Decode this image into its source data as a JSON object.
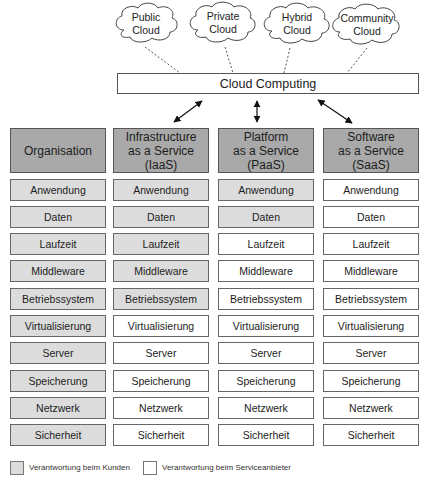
{
  "clouds": [
    {
      "line1": "Public",
      "line2": "Cloud"
    },
    {
      "line1": "Private",
      "line2": "Cloud"
    },
    {
      "line1": "Hybrid",
      "line2": "Cloud"
    },
    {
      "line1": "Community",
      "line2": "Cloud"
    }
  ],
  "cloud_computing": {
    "label": "Cloud Computing"
  },
  "columns": [
    {
      "header": [
        "Organisation"
      ],
      "cells": [
        {
          "label": "Anwendung",
          "responsibility": "customer"
        },
        {
          "label": "Daten",
          "responsibility": "customer"
        },
        {
          "label": "Laufzeit",
          "responsibility": "customer"
        },
        {
          "label": "Middleware",
          "responsibility": "customer"
        },
        {
          "label": "Betriebssystem",
          "responsibility": "customer"
        },
        {
          "label": "Virtualisierung",
          "responsibility": "customer"
        },
        {
          "label": "Server",
          "responsibility": "customer"
        },
        {
          "label": "Speicherung",
          "responsibility": "customer"
        },
        {
          "label": "Netzwerk",
          "responsibility": "customer"
        },
        {
          "label": "Sicherheit",
          "responsibility": "customer"
        }
      ]
    },
    {
      "header": [
        "Infrastructure",
        "as a Service",
        "(IaaS)"
      ],
      "cells": [
        {
          "label": "Anwendung",
          "responsibility": "customer"
        },
        {
          "label": "Daten",
          "responsibility": "customer"
        },
        {
          "label": "Laufzeit",
          "responsibility": "customer"
        },
        {
          "label": "Middleware",
          "responsibility": "customer"
        },
        {
          "label": "Betriebssystem",
          "responsibility": "customer"
        },
        {
          "label": "Virtualisierung",
          "responsibility": "provider"
        },
        {
          "label": "Server",
          "responsibility": "provider"
        },
        {
          "label": "Speicherung",
          "responsibility": "provider"
        },
        {
          "label": "Netzwerk",
          "responsibility": "provider"
        },
        {
          "label": "Sicherheit",
          "responsibility": "provider"
        }
      ]
    },
    {
      "header": [
        "Platform",
        "as a Service",
        "(PaaS)"
      ],
      "cells": [
        {
          "label": "Anwendung",
          "responsibility": "customer"
        },
        {
          "label": "Daten",
          "responsibility": "customer"
        },
        {
          "label": "Laufzeit",
          "responsibility": "provider"
        },
        {
          "label": "Middleware",
          "responsibility": "provider"
        },
        {
          "label": "Betriebssystem",
          "responsibility": "provider"
        },
        {
          "label": "Virtualisierung",
          "responsibility": "provider"
        },
        {
          "label": "Server",
          "responsibility": "provider"
        },
        {
          "label": "Speicherung",
          "responsibility": "provider"
        },
        {
          "label": "Netzwerk",
          "responsibility": "provider"
        },
        {
          "label": "Sicherheit",
          "responsibility": "provider"
        }
      ]
    },
    {
      "header": [
        "Software",
        "as a Service",
        "(SaaS)"
      ],
      "cells": [
        {
          "label": "Anwendung",
          "responsibility": "provider"
        },
        {
          "label": "Daten",
          "responsibility": "provider"
        },
        {
          "label": "Laufzeit",
          "responsibility": "provider"
        },
        {
          "label": "Middleware",
          "responsibility": "provider"
        },
        {
          "label": "Betriebssystem",
          "responsibility": "provider"
        },
        {
          "label": "Virtualisierung",
          "responsibility": "provider"
        },
        {
          "label": "Server",
          "responsibility": "provider"
        },
        {
          "label": "Speicherung",
          "responsibility": "provider"
        },
        {
          "label": "Netzwerk",
          "responsibility": "provider"
        },
        {
          "label": "Sicherheit",
          "responsibility": "provider"
        }
      ]
    }
  ],
  "legend": [
    {
      "label": "Verantwortung beim Kunden",
      "key": "customer"
    },
    {
      "label": "Verantwortung beim Serviceanbieter",
      "key": "provider"
    }
  ],
  "colors": {
    "header_fill": "#a9a9a9",
    "customer_fill": "#dcdcdc",
    "provider_fill": "#ffffff",
    "border": "#555555"
  }
}
